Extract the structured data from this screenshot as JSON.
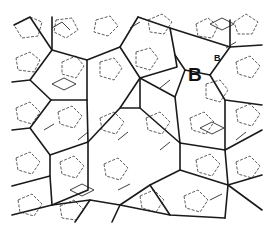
{
  "figure": {
    "labels": [
      {
        "text": "B",
        "x": 188,
        "y": 81,
        "size": 19
      },
      {
        "text": "B",
        "x": 214,
        "y": 61,
        "size": 9
      }
    ],
    "colors": {
      "line": "#1a1a1a",
      "background": "#ffffff"
    }
  }
}
